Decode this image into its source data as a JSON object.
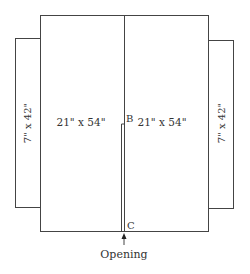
{
  "diagram": {
    "panels": {
      "left_main": {
        "label": "21\" x 54\""
      },
      "right_main": {
        "label": "21\" x 54\""
      },
      "left_flap": {
        "label": "7\" x 42\""
      },
      "right_flap": {
        "label": "7\" x 42\""
      }
    },
    "points": {
      "b": "B",
      "c": "C"
    },
    "opening_label": "Opening",
    "colors": {
      "line": "#444444",
      "text": "#333333",
      "background": "#ffffff"
    }
  }
}
